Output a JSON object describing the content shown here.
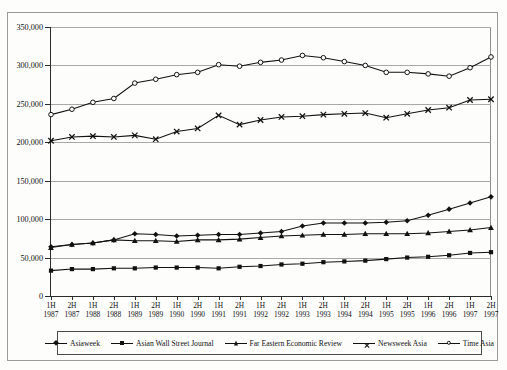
{
  "scan": {
    "top_ghost_text": " "
  },
  "chart_data": {
    "type": "line",
    "title": "",
    "xlabel": "",
    "ylabel": "",
    "ylim": [
      0,
      350000
    ],
    "yticks": [
      0,
      50000,
      100000,
      150000,
      200000,
      250000,
      300000,
      350000
    ],
    "ytick_labels": [
      "0",
      "50,000",
      "100,000",
      "150,000",
      "200,000",
      "250,000",
      "300,000",
      "350,000"
    ],
    "grid": true,
    "legend_position": "bottom",
    "categories": [
      "1H 1987",
      "2H 1987",
      "1H 1988",
      "2H 1988",
      "1H 1989",
      "2H 1989",
      "1H 1990",
      "2H 1990",
      "1H 1991",
      "2H 1991",
      "1H 1992",
      "2H 1992",
      "1H 1993",
      "2H 1993",
      "1H 1994",
      "2H 1994",
      "1H 1995",
      "2H 1995",
      "1H 1996",
      "2H 1996",
      "1H 1997",
      "2H 1997"
    ],
    "category_lines": [
      [
        "1H",
        "1987"
      ],
      [
        "2H",
        "1987"
      ],
      [
        "1H",
        "1988"
      ],
      [
        "2H",
        "1988"
      ],
      [
        "1H",
        "1989"
      ],
      [
        "2H",
        "1989"
      ],
      [
        "1H",
        "1990"
      ],
      [
        "2H",
        "1990"
      ],
      [
        "1H",
        "1991"
      ],
      [
        "2H",
        "1991"
      ],
      [
        "1H",
        "1992"
      ],
      [
        "2H",
        "1992"
      ],
      [
        "1H",
        "1993"
      ],
      [
        "2H",
        "1993"
      ],
      [
        "1H",
        "1994"
      ],
      [
        "2H",
        "1994"
      ],
      [
        "1H",
        "1995"
      ],
      [
        "2H",
        "1995"
      ],
      [
        "1H",
        "1996"
      ],
      [
        "2H",
        "1996"
      ],
      [
        "1H",
        "1997"
      ],
      [
        "2H",
        "1997"
      ]
    ],
    "series": [
      {
        "name": "Asiaweek",
        "marker": "diamond",
        "values": [
          64000,
          67000,
          69000,
          73000,
          81000,
          80000,
          78000,
          79000,
          80000,
          80000,
          82000,
          84000,
          91000,
          95000,
          95000,
          95000,
          96000,
          98000,
          105000,
          113000,
          121000,
          129000
        ]
      },
      {
        "name": "Asian Wall Street Journal",
        "marker": "square",
        "values": [
          33000,
          35000,
          35000,
          36000,
          36000,
          37000,
          37000,
          37000,
          36000,
          38000,
          39000,
          41000,
          42000,
          44000,
          45000,
          46000,
          48000,
          50000,
          51000,
          53000,
          56000,
          57000
        ]
      },
      {
        "name": "Far Eastern Economic Review",
        "marker": "triangle",
        "values": [
          63000,
          67000,
          69000,
          73000,
          72000,
          72000,
          71000,
          73000,
          73000,
          74000,
          76000,
          78000,
          79000,
          80000,
          80000,
          81000,
          81000,
          81000,
          82000,
          84000,
          86000,
          89000
        ]
      },
      {
        "name": "Newsweek Asia",
        "marker": "x",
        "values": [
          202000,
          207000,
          208000,
          207000,
          209000,
          204000,
          214000,
          218000,
          235000,
          223000,
          229000,
          233000,
          234000,
          236000,
          237000,
          238000,
          232000,
          237000,
          242000,
          245000,
          255000,
          256000
        ]
      },
      {
        "name": "Time Asia",
        "marker": "circle",
        "values": [
          236000,
          243000,
          252000,
          257000,
          277000,
          282000,
          288000,
          291000,
          301000,
          299000,
          304000,
          307000,
          313000,
          310000,
          305000,
          300000,
          291000,
          291000,
          289000,
          286000,
          297000,
          311000
        ]
      }
    ]
  }
}
